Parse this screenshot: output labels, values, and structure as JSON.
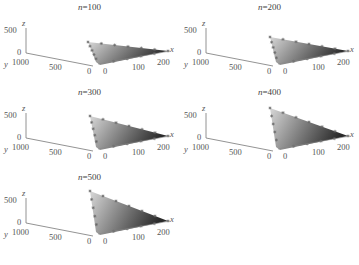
{
  "chart_data": [
    {
      "type": "surface3d",
      "title": "n=100",
      "n": 100,
      "xlabel": "x",
      "ylabel": "y",
      "zlabel": "z",
      "x_ticks": [
        "0",
        "100",
        "200"
      ],
      "y_ticks": [
        "1000",
        "500",
        "0"
      ],
      "z_ticks": [
        "0",
        "500"
      ],
      "xlim": [
        0,
        200
      ],
      "ylim": [
        0,
        1000
      ],
      "zlim": [
        0,
        500
      ],
      "approx_max_z": 250,
      "grid": false
    },
    {
      "type": "surface3d",
      "title": "n=200",
      "n": 200,
      "xlabel": "x",
      "ylabel": "y",
      "zlabel": "z",
      "x_ticks": [
        "0",
        "100",
        "200"
      ],
      "y_ticks": [
        "1000",
        "500",
        "0"
      ],
      "z_ticks": [
        "0",
        "500"
      ],
      "xlim": [
        0,
        200
      ],
      "ylim": [
        0,
        1000
      ],
      "zlim": [
        0,
        500
      ],
      "approx_max_z": 350,
      "grid": false
    },
    {
      "type": "surface3d",
      "title": "n=300",
      "n": 300,
      "xlabel": "x",
      "ylabel": "y",
      "zlabel": "z",
      "x_ticks": [
        "0",
        "100",
        "200"
      ],
      "y_ticks": [
        "1000",
        "500",
        "0"
      ],
      "z_ticks": [
        "0",
        "500"
      ],
      "xlim": [
        0,
        200
      ],
      "ylim": [
        0,
        1000
      ],
      "zlim": [
        0,
        500
      ],
      "approx_max_z": 450,
      "grid": false
    },
    {
      "type": "surface3d",
      "title": "n=400",
      "n": 400,
      "xlabel": "x",
      "ylabel": "y",
      "zlabel": "z",
      "x_ticks": [
        "0",
        "100",
        "200"
      ],
      "y_ticks": [
        "1000",
        "500",
        "0"
      ],
      "z_ticks": [
        "0",
        "500"
      ],
      "xlim": [
        0,
        200
      ],
      "ylim": [
        0,
        1000
      ],
      "zlim": [
        0,
        500
      ],
      "approx_max_z": 550,
      "grid": false
    },
    {
      "type": "surface3d",
      "title": "n=500",
      "n": 500,
      "xlabel": "x",
      "ylabel": "y",
      "zlabel": "z",
      "x_ticks": [
        "0",
        "100",
        "200"
      ],
      "y_ticks": [
        "1000",
        "500",
        "0"
      ],
      "z_ticks": [
        "0",
        "500"
      ],
      "xlim": [
        0,
        200
      ],
      "ylim": [
        0,
        1000
      ],
      "zlim": [
        0,
        500
      ],
      "approx_max_z": 600,
      "grid": false
    }
  ],
  "panels": [
    {
      "prefix": "n",
      "value": "=100"
    },
    {
      "prefix": "n",
      "value": "=200"
    },
    {
      "prefix": "n",
      "value": "=300"
    },
    {
      "prefix": "n",
      "value": "=400"
    },
    {
      "prefix": "n",
      "value": "=500"
    }
  ],
  "axes": {
    "x": "x",
    "y": "y",
    "z": "z",
    "x_ticks": [
      "0",
      "100",
      "200"
    ],
    "y_ticks": [
      "1000",
      "500",
      "0"
    ],
    "z_ticks": [
      "500",
      "0"
    ]
  }
}
